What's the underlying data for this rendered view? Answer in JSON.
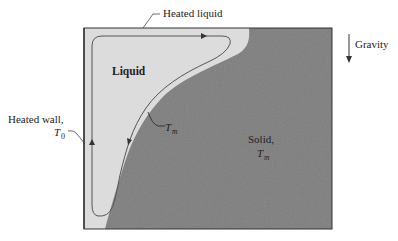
{
  "figure": {
    "regions": {
      "liquid": {
        "label": "Liquid",
        "color": "#dcdcdc"
      },
      "solid": {
        "label": "Solid,",
        "temp_symbol": "T",
        "temp_sub": "m",
        "color": "#7f7f7f"
      }
    },
    "annotations": {
      "heated_liquid": "Heated liquid",
      "heated_wall": "Heated wall,",
      "wall_temp_symbol": "T",
      "wall_temp_sub": "0",
      "interface_temp_symbol": "T",
      "interface_temp_sub": "m",
      "gravity": "Gravity"
    },
    "colors": {
      "outline": "#333333",
      "flow_line": "#555555",
      "text": "#222222"
    }
  }
}
